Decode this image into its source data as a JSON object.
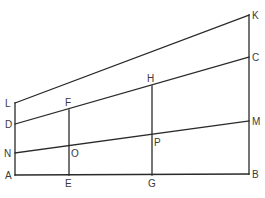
{
  "diagram": {
    "type": "geometric-construction",
    "points": {
      "A": "A",
      "B": "B",
      "C": "C",
      "D": "D",
      "E": "E",
      "F": "F",
      "G": "G",
      "H": "H",
      "K": "K",
      "L": "L",
      "M": "M",
      "N": "N",
      "O": "O",
      "P": "P"
    },
    "segments": [
      [
        "A",
        "B"
      ],
      [
        "A",
        "L"
      ],
      [
        "B",
        "K"
      ],
      [
        "L",
        "K"
      ],
      [
        "D",
        "C"
      ],
      [
        "N",
        "M"
      ],
      [
        "E",
        "F"
      ],
      [
        "G",
        "H"
      ]
    ],
    "colors": {
      "line": "#2a2a2a",
      "label": "#3a3a3a",
      "background": "#ffffff"
    }
  }
}
